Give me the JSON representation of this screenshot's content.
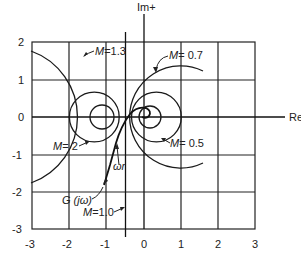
{
  "figure": {
    "type": "Nyquist plot with M-circles",
    "axes": {
      "x_label": "Re+",
      "y_label": "Im+",
      "x_ticks": [
        "-3",
        "-2",
        "-1",
        "0",
        "1",
        "2",
        "3"
      ],
      "y_ticks": [
        "2",
        "1",
        "0",
        "-1",
        "-2",
        "-3"
      ],
      "x_range": [
        -3,
        3
      ],
      "y_range": [
        -3,
        2
      ]
    },
    "m_circles": [
      {
        "label": "M = 1.3",
        "M": 1.3,
        "center": [
          -2.45,
          0
        ],
        "radius": 1.88
      },
      {
        "label": "M = 2",
        "M": 2,
        "center": [
          -1.333,
          0
        ],
        "radius": 0.667
      },
      {
        "label": "",
        "M": 3,
        "center": [
          -1.125,
          0
        ],
        "radius": 0.375
      },
      {
        "label": "M = 0.7",
        "M": 0.7,
        "center": [
          0.96,
          0
        ],
        "radius": 1.37
      },
      {
        "label": "M = 0.5",
        "M": 0.5,
        "center": [
          0.333,
          0
        ],
        "radius": 0.667
      },
      {
        "label": "",
        "M": 0.3,
        "center": [
          0.1,
          0
        ],
        "radius": 0.33
      },
      {
        "label": "M = 1.0",
        "M": 1.0,
        "line_x": -0.5
      }
    ],
    "labels": {
      "m13_prefix": "M",
      "m13_value": "=1.3",
      "m07_prefix": "M",
      "m07_value": "= 0.7",
      "m2_prefix": "M",
      "m2_value": "= 2",
      "m05_prefix": "M",
      "m05_value": "= 0.5",
      "m10_prefix": "M",
      "m10_value": "=1.0",
      "g_label": "G (jω)",
      "omega_r": "ωr"
    },
    "curve": {
      "name": "G(jω)",
      "tangent_point_label": "ωr"
    }
  }
}
